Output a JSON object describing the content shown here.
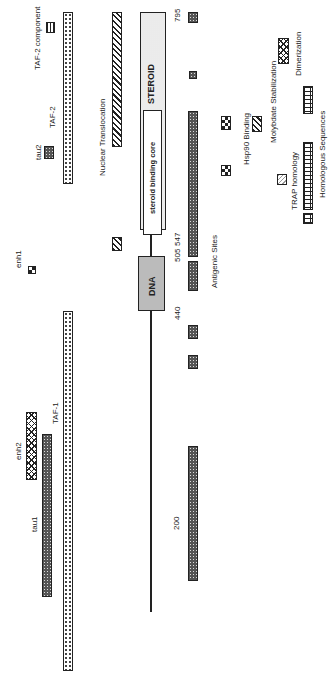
{
  "diagram": {
    "labels": {
      "taf2_component": "TAF-2 component",
      "taf2": "TAF-2",
      "tau2": "tau2",
      "enh1": "enh1",
      "enh2": "enh2",
      "tau1": "tau1",
      "taf1": "TAF-1",
      "nuclear_translocation": "Nuclear Translocation",
      "steroid": "STEROID",
      "steroid_binding_core": "steroid binding core",
      "dna": "DNA",
      "antigenic_sites": "Antigenic Sites",
      "hsp90_binding": "Hsp90 Binding",
      "molybdate_stabilization": "Molybdate Stabilization",
      "trap_homology": "TRAP homology",
      "homologous_sequences": "Homologous Sequences",
      "dimerization": "Dimerization"
    },
    "positions": {
      "p795": "795",
      "p547": "547",
      "p505": "505",
      "p440": "440",
      "p200": "200"
    }
  }
}
